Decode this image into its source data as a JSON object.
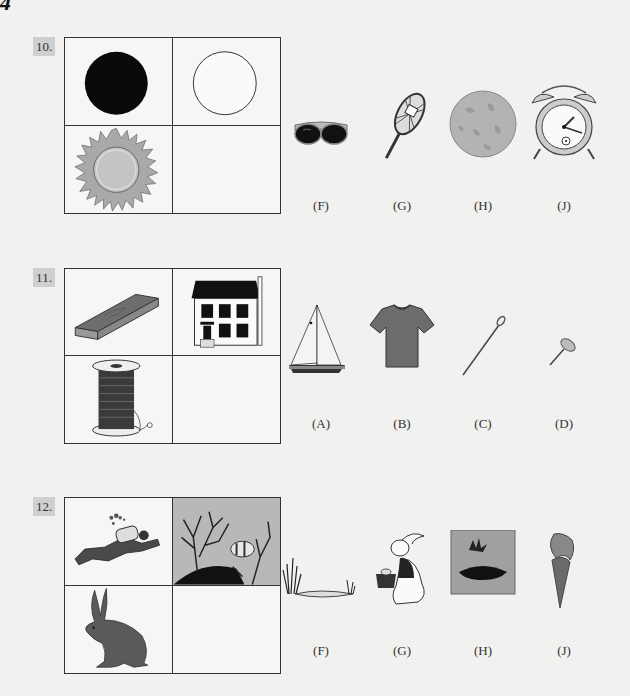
{
  "page": {
    "page_number": "4"
  },
  "questions": [
    {
      "number": "10.",
      "grid": {
        "top_left": "black-circle",
        "top_right": "white-circle-outline",
        "bottom_left": "sun",
        "bottom_right": "empty"
      },
      "choices": [
        {
          "label": "(F)",
          "icon": "sunglasses"
        },
        {
          "label": "(G)",
          "icon": "snowshoe"
        },
        {
          "label": "(H)",
          "icon": "full-moon"
        },
        {
          "label": "(J)",
          "icon": "alarm-clock"
        }
      ]
    },
    {
      "number": "11.",
      "grid": {
        "top_left": "wooden-plank",
        "top_right": "house",
        "bottom_left": "thread-spool",
        "bottom_right": "empty"
      },
      "choices": [
        {
          "label": "(A)",
          "icon": "sailboat"
        },
        {
          "label": "(B)",
          "icon": "t-shirt"
        },
        {
          "label": "(C)",
          "icon": "sewing-needle"
        },
        {
          "label": "(D)",
          "icon": "thumbtack"
        }
      ]
    },
    {
      "number": "12.",
      "grid": {
        "top_left": "scuba-diver",
        "top_right": "coral-reef-clownfish",
        "bottom_left": "hare",
        "bottom_right": "empty"
      },
      "choices": [
        {
          "label": "(F)",
          "icon": "pond-with-reeds"
        },
        {
          "label": "(G)",
          "icon": "rabbit-with-basket"
        },
        {
          "label": "(H)",
          "icon": "grass-nest"
        },
        {
          "label": "(J)",
          "icon": "carrot"
        }
      ]
    }
  ]
}
